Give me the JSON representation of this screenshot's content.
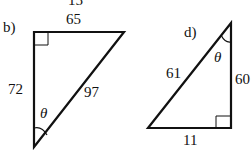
{
  "top_clip_label": "15",
  "triangles": [
    {
      "id": "b",
      "label": "b)",
      "sides": {
        "top": "65",
        "left": "72",
        "hypotenuse": "97"
      },
      "angle": "θ",
      "right_angle_at": "top-left",
      "theta_at": "bottom"
    },
    {
      "id": "d",
      "label": "d)",
      "sides": {
        "hypotenuse": "61",
        "right": "60",
        "bottom": "11"
      },
      "angle": "θ",
      "right_angle_at": "bottom-right",
      "theta_at": "top"
    }
  ],
  "colors": {
    "stroke": "#111111",
    "background": "#ffffff"
  }
}
